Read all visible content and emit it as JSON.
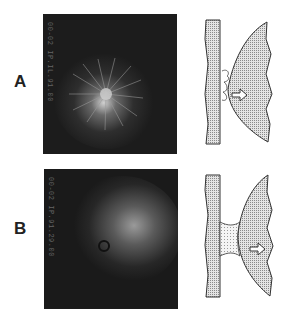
{
  "figure": {
    "panels": [
      {
        "label": "A",
        "micrograph": {
          "side_text": "00-02 IP.IL.91.00",
          "description": "diffuse radial streaks pattern"
        },
        "diagram": {
          "description": "cell with ruffled contact zone at substrate, arrow pointing right"
        }
      },
      {
        "label": "B",
        "micrograph": {
          "side_text": "00-02 IP.91.29.00",
          "description": "diffuse glow with small dark ring"
        },
        "diagram": {
          "description": "cell attached to substrate via dotted tether neck, arrow pointing right"
        }
      }
    ]
  }
}
